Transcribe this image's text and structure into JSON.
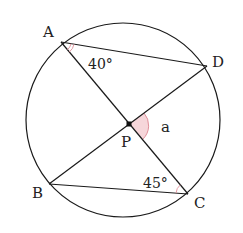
{
  "diagram": {
    "type": "circle-geometry",
    "colors": {
      "line": "#1a1a1a",
      "angle_mark": "#e0909a",
      "angle_fill": "#f6d6da",
      "text": "#222222"
    },
    "circle": {
      "cx": 123,
      "cy": 120,
      "r": 97
    },
    "points": {
      "A": {
        "x": 61,
        "y": 42,
        "label": "A"
      },
      "B": {
        "x": 49,
        "y": 184,
        "label": "B"
      },
      "C": {
        "x": 188,
        "y": 194,
        "label": "C"
      },
      "D": {
        "x": 207,
        "y": 66,
        "label": "D"
      },
      "P": {
        "x": 129,
        "y": 124,
        "label": "P"
      }
    },
    "segments": [
      "AD",
      "AC",
      "BD",
      "BC"
    ],
    "angles": {
      "DAC": {
        "vertex": "A",
        "label": "40°"
      },
      "BCA": {
        "vertex": "C",
        "label": "45°"
      },
      "DPC": {
        "vertex": "P",
        "label": "a",
        "shaded": true
      }
    }
  }
}
